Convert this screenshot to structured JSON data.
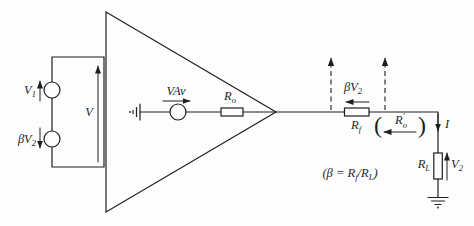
{
  "colors": {
    "background": "#fdfdfd",
    "ink": "#1f1f1f"
  },
  "source_loop": {
    "v1": {
      "base": "V",
      "sub": "1"
    },
    "beta_v2": {
      "base": "βV",
      "sub": "2"
    },
    "v": "V"
  },
  "amplifier": {
    "vav": "VAv",
    "ro": {
      "base": "R",
      "sub": "o"
    }
  },
  "feedback": {
    "beta_v2": {
      "base": "βV",
      "sub": "2"
    },
    "rf": {
      "base": "R",
      "sub": "f"
    },
    "ro_prime": {
      "base": "R",
      "sub": "o",
      "prime": "′"
    },
    "paren_open": "(",
    "paren_close": ")"
  },
  "load": {
    "i": "I",
    "rl": {
      "base": "R",
      "sub": "L"
    },
    "v2": {
      "base": "V",
      "sub": "2"
    }
  },
  "formula": {
    "open": "(β = ",
    "rf_base": "R",
    "rf_sub": "f",
    "slash": "/",
    "rl_base": "R",
    "rl_sub": "L",
    "close": ")"
  }
}
